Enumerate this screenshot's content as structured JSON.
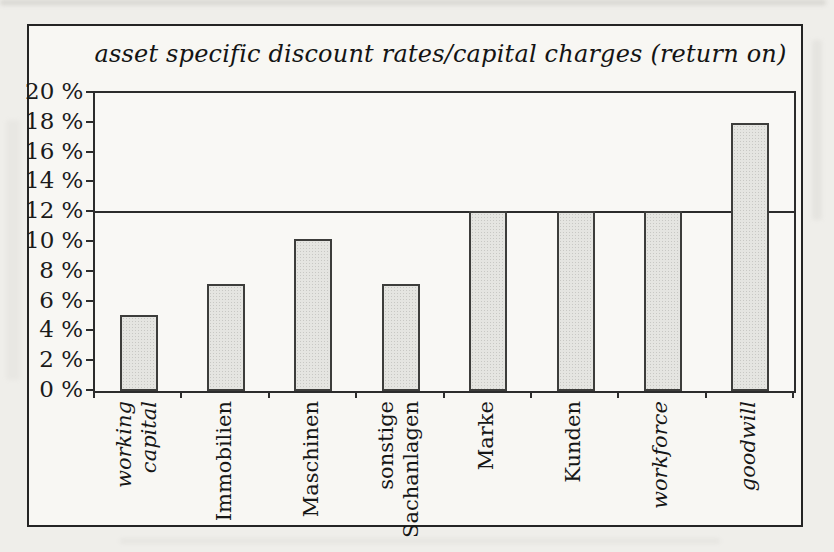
{
  "chart_data": {
    "type": "bar",
    "title": "asset specific discount rates/capital charges (return on)",
    "categories": [
      "working capital",
      "Immobilien",
      "Maschinen",
      "sonstige Sachanlagen",
      "Marke",
      "Kunden",
      "workforce",
      "goodwill"
    ],
    "category_lines": [
      [
        "working",
        "capital"
      ],
      [
        "Immobilien"
      ],
      [
        "Maschinen"
      ],
      [
        "sonstige",
        "Sachanlagen"
      ],
      [
        "Marke"
      ],
      [
        "Kunden"
      ],
      [
        "workforce"
      ],
      [
        "goodwill"
      ]
    ],
    "category_italic": [
      true,
      false,
      false,
      false,
      false,
      false,
      true,
      true
    ],
    "values": [
      5.1,
      7.2,
      10.2,
      7.2,
      12.1,
      12.1,
      12.1,
      18.0
    ],
    "xlabel": "",
    "ylabel": "",
    "y_ticks": [
      0,
      2,
      4,
      6,
      8,
      10,
      12,
      14,
      16,
      18,
      20
    ],
    "y_tick_suffix": " %",
    "ylim": [
      0,
      20
    ],
    "reference_line": 12,
    "grid": "off",
    "legend": "none",
    "colors": {
      "bar_fill": "#e5e5e1",
      "bar_border": "#3d3d3b",
      "axis": "#2c2c2c",
      "frame_border": "#242424",
      "paper": "#f8f7f3"
    }
  }
}
